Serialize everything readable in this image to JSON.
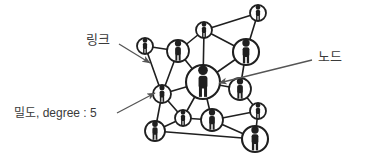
{
  "figure": {
    "kind": "social-network-diagram",
    "background_color": "#ffffff",
    "ink_color": "#1f1f1f",
    "annotation_color": "#3a3a3a",
    "arrow_color": "#555555"
  },
  "annotations": [
    {
      "id": "link-label",
      "text": "링크",
      "meaning": "link",
      "x": 86,
      "y": 33,
      "font_size": 13,
      "arrow": {
        "x1": 119,
        "y1": 44,
        "x2": 150,
        "y2": 63
      }
    },
    {
      "id": "node-label",
      "text": "노드",
      "meaning": "node",
      "x": 318,
      "y": 50,
      "font_size": 13,
      "arrow": {
        "x1": 312,
        "y1": 60,
        "x2": 219,
        "y2": 83
      }
    },
    {
      "id": "degree-label",
      "text": "밀도, degree : 5",
      "meaning": "density, degree : 5",
      "x": 14,
      "y": 107,
      "font_size": 12,
      "arrow": {
        "x1": 117,
        "y1": 113,
        "x2": 155,
        "y2": 93
      }
    }
  ],
  "graph": {
    "node_fill": "#ffffff",
    "node_stroke": "#1f1f1f",
    "edge_stroke": "#1f1f1f",
    "nodes": [
      {
        "id": "n1",
        "x": 258,
        "y": 13,
        "r": 8,
        "size": "small",
        "label": "person"
      },
      {
        "id": "n2",
        "x": 204,
        "y": 30,
        "r": 8,
        "size": "small",
        "label": "person"
      },
      {
        "id": "n3",
        "x": 145,
        "y": 46,
        "r": 8,
        "size": "small",
        "label": "person"
      },
      {
        "id": "n4",
        "x": 178,
        "y": 51,
        "r": 11,
        "size": "medium",
        "label": "person"
      },
      {
        "id": "n5",
        "x": 246,
        "y": 52,
        "r": 13,
        "size": "medium",
        "label": "person"
      },
      {
        "id": "n6",
        "x": 203,
        "y": 82,
        "r": 17,
        "size": "large",
        "label": "person"
      },
      {
        "id": "n7",
        "x": 240,
        "y": 89,
        "r": 11,
        "size": "medium",
        "label": "person"
      },
      {
        "id": "n8",
        "x": 162,
        "y": 94,
        "r": 9,
        "size": "small",
        "label": "person"
      },
      {
        "id": "n9",
        "x": 258,
        "y": 111,
        "r": 8,
        "size": "small",
        "label": "person"
      },
      {
        "id": "n10",
        "x": 183,
        "y": 118,
        "r": 8,
        "size": "small",
        "label": "person"
      },
      {
        "id": "n11",
        "x": 212,
        "y": 120,
        "r": 11,
        "size": "medium",
        "label": "person"
      },
      {
        "id": "n12",
        "x": 155,
        "y": 131,
        "r": 10,
        "size": "medium",
        "label": "person"
      },
      {
        "id": "n13",
        "x": 255,
        "y": 139,
        "r": 13,
        "size": "medium",
        "label": "person"
      }
    ],
    "edges": [
      [
        "n1",
        "n2"
      ],
      [
        "n1",
        "n5"
      ],
      [
        "n2",
        "n4"
      ],
      [
        "n2",
        "n5"
      ],
      [
        "n2",
        "n6"
      ],
      [
        "n3",
        "n4"
      ],
      [
        "n3",
        "n8"
      ],
      [
        "n4",
        "n6"
      ],
      [
        "n4",
        "n8"
      ],
      [
        "n5",
        "n6"
      ],
      [
        "n5",
        "n7"
      ],
      [
        "n6",
        "n7"
      ],
      [
        "n6",
        "n8"
      ],
      [
        "n6",
        "n10"
      ],
      [
        "n6",
        "n11"
      ],
      [
        "n7",
        "n9"
      ],
      [
        "n8",
        "n10"
      ],
      [
        "n8",
        "n12"
      ],
      [
        "n9",
        "n11"
      ],
      [
        "n9",
        "n13"
      ],
      [
        "n10",
        "n11"
      ],
      [
        "n10",
        "n12"
      ],
      [
        "n11",
        "n13"
      ],
      [
        "n12",
        "n13"
      ]
    ],
    "degree_highlight": {
      "node": "n8",
      "degree": 5
    }
  }
}
